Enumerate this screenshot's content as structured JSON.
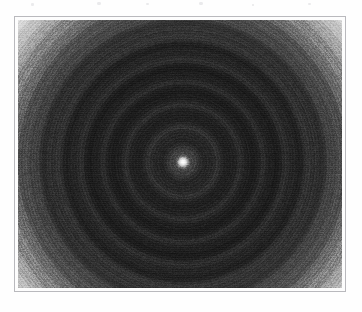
{
  "page": {
    "background_color": "#fefefe",
    "width": 362,
    "height": 312
  },
  "artifacts": {
    "name": "scan-speck-artifacts",
    "note": "faint residual ink specks from a caption line cropped away above the figure",
    "color": "#d9d9dd",
    "specks": [
      {
        "x": 31,
        "y": 3,
        "w": 3,
        "h": 3
      },
      {
        "x": 97,
        "y": 2,
        "w": 4,
        "h": 3
      },
      {
        "x": 146,
        "y": 3,
        "w": 3,
        "h": 2
      },
      {
        "x": 199,
        "y": 2,
        "w": 4,
        "h": 3
      },
      {
        "x": 252,
        "y": 4,
        "w": 2,
        "h": 2
      },
      {
        "x": 308,
        "y": 3,
        "w": 3,
        "h": 2
      }
    ]
  },
  "frame": {
    "name": "figure-border",
    "border_color": "#b9b9bd",
    "fill_color": "#fdfdfd",
    "x": 14,
    "y": 16,
    "width": 332,
    "height": 276
  },
  "chart_data": {
    "type": "heatmap",
    "title": "",
    "subtitle": "",
    "xlabel": "",
    "ylabel": "",
    "colormap": "grayscale",
    "legend": "none",
    "grid": false,
    "pattern": "concentric-rings",
    "center": {
      "x": 183,
      "y": 162
    },
    "axis_units": "pixels",
    "xlim": [
      17,
      343
    ],
    "ylim": [
      19,
      289
    ],
    "value_range": [
      0,
      255
    ],
    "radial_profile": {
      "note": "normalized intensity (0 = black, 255 = white) sampled versus radius in pixels from the bright core",
      "radius_px": [
        0,
        2,
        5,
        10,
        18,
        28,
        40,
        55,
        70,
        85,
        100,
        115,
        128,
        140,
        152,
        163,
        172,
        180,
        190,
        205,
        225
      ],
      "intensity": [
        242,
        188,
        58,
        38,
        30,
        26,
        23,
        21,
        22,
        26,
        34,
        52,
        86,
        134,
        182,
        220,
        242,
        248,
        238,
        206,
        182
      ]
    },
    "ring_structure": {
      "fine_ring_period_px": 3,
      "coarse_ring_period_px": 11,
      "visible_ring_count": 14,
      "core_radius_px": 4,
      "dark_disk_outer_radius_px": 112,
      "bright_halo_peak_radius_px": 178
    },
    "regions": [
      {
        "name": "central-bright-core",
        "radius_px": 4,
        "mean_gray": 238
      },
      {
        "name": "inner-dark-disk",
        "radius_px": 112,
        "mean_gray": 28
      },
      {
        "name": "transition-gradient",
        "radius_px": 152,
        "mean_gray": 120
      },
      {
        "name": "bright-halo-ring",
        "radius_px": 185,
        "mean_gray": 240
      },
      {
        "name": "outer-falloff",
        "radius_px": 230,
        "mean_gray": 186
      }
    ]
  }
}
